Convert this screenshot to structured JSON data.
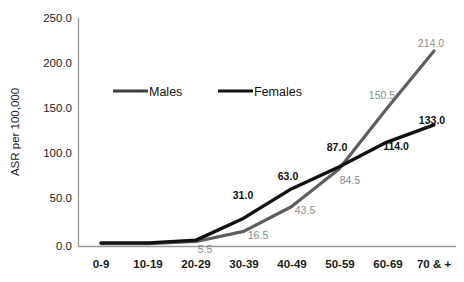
{
  "chart_data": {
    "type": "line",
    "title": "",
    "subtitle": "",
    "xlabel": "",
    "ylabel": "ASR per 100,000",
    "categories": [
      "0-9",
      "10-19",
      "20-29",
      "30-39",
      "40-49",
      "50-59",
      "60-69",
      "70 & +"
    ],
    "ylim": [
      0,
      250
    ],
    "ytick_labels": [
      "0.0",
      "50.0",
      "100.0",
      "150.0",
      "200.0",
      "250.0"
    ],
    "ytick_values": [
      0,
      50,
      100,
      150,
      200,
      250
    ],
    "grid": false,
    "legend_position": "top-center-inside",
    "series": [
      {
        "name": "Males",
        "color": "#5e5e5e",
        "label_color": "#8a8a8a",
        "values": [
          3.0,
          3.0,
          5.5,
          16.5,
          43.5,
          84.5,
          150.5,
          214.0
        ],
        "point_labels": [
          "",
          "",
          "5.5",
          "16.5",
          "43.5",
          "84.5",
          "150.5",
          "214.0"
        ]
      },
      {
        "name": "Females",
        "color": "#111111",
        "label_color": "#111111",
        "values": [
          4.0,
          4.0,
          7.0,
          31.0,
          63.0,
          87.0,
          114.0,
          133.0
        ],
        "point_labels": [
          "",
          "",
          "",
          "31.0",
          "63.0",
          "87.0",
          "114.0",
          "133.0"
        ]
      }
    ]
  },
  "axis": {
    "y_title": "ASR per 100,000",
    "y_ticks": [
      {
        "label": "250.0"
      },
      {
        "label": "200.0"
      },
      {
        "label": "150.0"
      },
      {
        "label": "100.0"
      },
      {
        "label": "50.0"
      },
      {
        "label": "0.0"
      }
    ],
    "x_ticks": [
      {
        "label": "0-9"
      },
      {
        "label": "10-19"
      },
      {
        "label": "20-29"
      },
      {
        "label": "30-39"
      },
      {
        "label": "40-49"
      },
      {
        "label": "50-59"
      },
      {
        "label": "60-69"
      },
      {
        "label": "70 & +"
      }
    ]
  },
  "legend": {
    "items": [
      {
        "label": "Males",
        "color": "#3d3d3d"
      },
      {
        "label": "Females",
        "color": "#111111"
      }
    ]
  },
  "labels": {
    "males": {
      "p2": "5.5",
      "p3": "16.5",
      "p4": "43.5",
      "p5": "84.5",
      "p6": "150.5",
      "p7": "214.0"
    },
    "females": {
      "p3": "31.0",
      "p4": "63.0",
      "p5": "87.0",
      "p6": "114.0",
      "p7": "133.0"
    }
  }
}
